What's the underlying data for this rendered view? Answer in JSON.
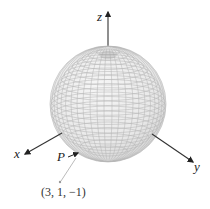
{
  "figure": {
    "axes": {
      "x_label": "x",
      "y_label": "y",
      "z_label": "z"
    },
    "point": {
      "label": "P",
      "coordinates_label": "(3, 1, −1)"
    },
    "colors": {
      "sphere_fill": "#eeeeee",
      "mesh_line": "#b5b5b5",
      "axis": "#333333",
      "leader_line": "#aaaaaa"
    }
  }
}
